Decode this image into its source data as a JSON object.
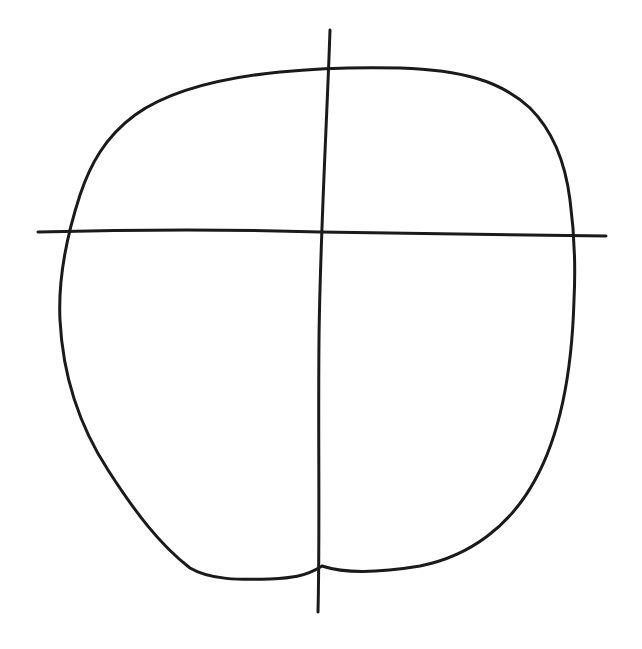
{
  "diagram": {
    "background_color": "#ffffff",
    "stroke_color": "#1a1a1a",
    "stroke_width": 3,
    "elements": [
      {
        "id": "outline",
        "type": "closed-curve",
        "path": "M 322 566 C 340 572 372 574 420 566 C 470 556 510 526 535 480 C 560 435 572 370 574 300 C 576 260 574 230 570 200 C 565 160 552 130 530 108 C 500 80 460 70 400 68 C 360 67 320 68 280 72 C 220 78 170 90 135 115 C 105 137 90 165 80 195 C 66 238 58 280 60 320 C 63 380 82 430 108 470 C 135 512 160 545 190 568 C 210 580 240 580 270 579 C 290 578 305 577 322 566 Z"
      },
      {
        "id": "vertical-guide",
        "type": "line",
        "path": "M 330 30 C 327 120 320 240 319 340 C 318 440 320 530 318 612"
      },
      {
        "id": "horizontal-guide",
        "type": "line",
        "path": "M 38 232 C 150 229 260 230 320 232 C 420 234 520 235 606 236"
      }
    ]
  }
}
